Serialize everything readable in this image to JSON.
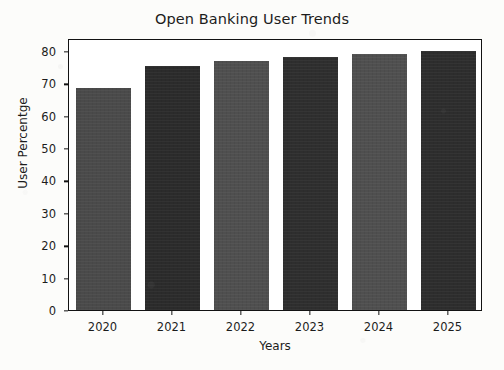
{
  "chart_data": {
    "type": "bar",
    "title": "Open Banking User Trends",
    "xlabel": "Years",
    "ylabel": "User Percentge",
    "categories": [
      "2020",
      "2021",
      "2022",
      "2023",
      "2024",
      "2025"
    ],
    "values": [
      68.5,
      75.5,
      77,
      78,
      79,
      80
    ],
    "ylim": [
      0,
      84
    ],
    "ytick_labels": [
      "0",
      "10",
      "20",
      "30",
      "40",
      "50",
      "60",
      "70",
      "80"
    ],
    "ytick_values": [
      0,
      10,
      20,
      30,
      40,
      50,
      60,
      70,
      80
    ],
    "grid": false,
    "legend": null,
    "bar_colors": [
      "#4a4a4a",
      "#2b2b2b",
      "#4f4f4f",
      "#2e2e2e",
      "#4f4f4f",
      "#2d2d2d"
    ],
    "axis_color": "#121212",
    "text_color": "#1c1c1c",
    "plot_background": "#ffffff",
    "figure_background": "#fcfcfa"
  }
}
